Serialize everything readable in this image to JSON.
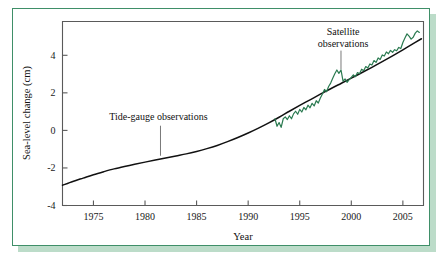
{
  "figure": {
    "frame_color": "#3f8f68",
    "shadow_color": "#bcdcc9",
    "background": "#ffffff"
  },
  "chart_data": {
    "type": "line",
    "title": "",
    "xlabel": "Year",
    "ylabel": "Sea-level change (cm)",
    "xlim": [
      1972,
      2007
    ],
    "ylim": [
      -4,
      5.8
    ],
    "xticks": [
      1975,
      1980,
      1985,
      1990,
      1995,
      2000,
      2005
    ],
    "xtick_labels": [
      "1975",
      "1980",
      "1985",
      "1990",
      "1995",
      "2000",
      "2005"
    ],
    "yticks": [
      -4,
      -2,
      0,
      2,
      4
    ],
    "ytick_labels": [
      "-4",
      "-2",
      "0",
      "2",
      "4"
    ],
    "grid": false,
    "legend": "none",
    "annotations": [
      {
        "name": "tide-gauge-annotation",
        "text": "Tide-gauge observations",
        "text_x": 1981.3,
        "text_y": 0.55,
        "leader_from_year": 1981.5,
        "leader_from_value": 0.25,
        "leader_to_year": 1981.5,
        "leader_to_value": -1.35
      },
      {
        "name": "satellite-annotation",
        "text_line1": "Satellite",
        "text_line2": "observations",
        "text_x": 1999.2,
        "text_y": 5.1,
        "leader_from_year": 1999.0,
        "leader_from_value": 4.25,
        "leader_to_year": 1999.0,
        "leader_to_value": 3.25
      }
    ],
    "series": [
      {
        "name": "Tide-gauge observations",
        "color": "#111111",
        "style": "smooth-line",
        "x": [
          1972.0,
          1973.0,
          1974.0,
          1975.0,
          1976.0,
          1977.0,
          1978.0,
          1979.0,
          1980.0,
          1981.0,
          1982.0,
          1983.0,
          1984.0,
          1985.0,
          1986.0,
          1987.0,
          1988.0,
          1989.0,
          1990.0,
          1991.0,
          1992.0,
          1993.0,
          1994.0,
          1995.0,
          1996.0,
          1997.0,
          1998.0,
          1999.0,
          2000.0,
          2001.0,
          2002.0,
          2003.0,
          2004.0,
          2005.0,
          2006.0,
          2006.8
        ],
        "y": [
          -2.92,
          -2.72,
          -2.54,
          -2.36,
          -2.2,
          -2.05,
          -1.92,
          -1.8,
          -1.69,
          -1.58,
          -1.47,
          -1.36,
          -1.25,
          -1.12,
          -0.97,
          -0.8,
          -0.6,
          -0.38,
          -0.14,
          0.12,
          0.4,
          0.7,
          1.02,
          1.33,
          1.63,
          1.93,
          2.22,
          2.5,
          2.78,
          3.07,
          3.36,
          3.66,
          3.97,
          4.29,
          4.62,
          4.88
        ]
      },
      {
        "name": "Satellite observations",
        "color": "#2a7a50",
        "style": "noisy-line",
        "x": [
          1992.6,
          1992.8,
          1993.0,
          1993.2,
          1993.4,
          1993.6,
          1993.8,
          1994.0,
          1994.2,
          1994.4,
          1994.6,
          1994.8,
          1995.0,
          1995.2,
          1995.4,
          1995.6,
          1995.8,
          1996.0,
          1996.2,
          1996.4,
          1996.6,
          1996.8,
          1997.0,
          1997.2,
          1997.4,
          1997.6,
          1997.8,
          1998.0,
          1998.2,
          1998.4,
          1998.6,
          1998.8,
          1999.0,
          1999.2,
          1999.4,
          1999.6,
          1999.8,
          2000.0,
          2000.2,
          2000.4,
          2000.6,
          2000.8,
          2001.0,
          2001.2,
          2001.4,
          2001.6,
          2001.8,
          2002.0,
          2002.2,
          2002.4,
          2002.6,
          2002.8,
          2003.0,
          2003.2,
          2003.4,
          2003.6,
          2003.8,
          2004.0,
          2004.2,
          2004.4,
          2004.6,
          2004.8,
          2005.0,
          2005.2,
          2005.4,
          2005.6,
          2005.8,
          2006.0,
          2006.2,
          2006.4,
          2006.6
        ],
        "y": [
          0.62,
          0.22,
          0.42,
          0.16,
          0.62,
          0.72,
          0.58,
          0.78,
          0.62,
          0.88,
          1.02,
          0.86,
          1.12,
          0.98,
          1.22,
          1.1,
          1.34,
          1.2,
          1.44,
          1.3,
          1.58,
          1.46,
          1.72,
          1.94,
          2.18,
          2.06,
          2.34,
          2.52,
          2.78,
          3.02,
          3.22,
          3.04,
          3.22,
          2.62,
          2.74,
          2.56,
          2.72,
          2.82,
          2.96,
          2.86,
          3.08,
          3.02,
          3.26,
          3.18,
          3.4,
          3.32,
          3.54,
          3.48,
          3.72,
          3.62,
          3.86,
          3.78,
          4.02,
          3.96,
          4.18,
          4.08,
          4.26,
          4.16,
          4.3,
          4.24,
          4.42,
          4.36,
          4.68,
          4.92,
          5.14,
          5.02,
          4.86,
          4.96,
          5.18,
          5.3,
          5.22
        ]
      }
    ]
  }
}
